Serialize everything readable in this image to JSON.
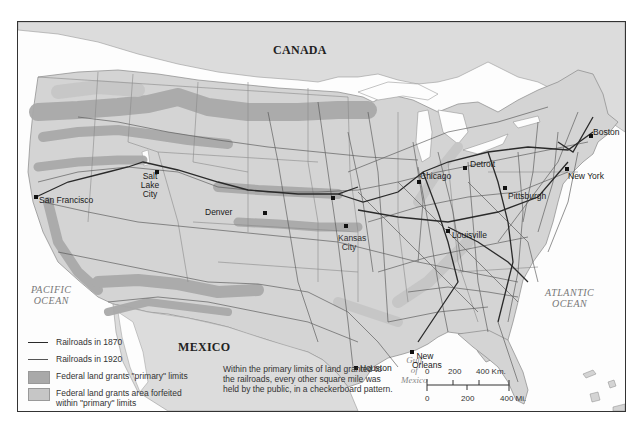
{
  "map": {
    "title": "",
    "countries": {
      "canada": "CANADA",
      "mexico": "MEXICO"
    },
    "oceans": {
      "pacific": [
        "PACIFIC",
        "OCEAN"
      ],
      "atlantic": [
        "ATLANTIC",
        "OCEAN"
      ],
      "gulf": [
        "Gulf",
        "of",
        "Mexico"
      ]
    },
    "cities": [
      {
        "name": "San Francisco",
        "x": 18,
        "y": 173
      },
      {
        "name": "Salt Lake City",
        "x": 124,
        "y": 150
      },
      {
        "name": "Denver",
        "x": 208,
        "y": 186
      },
      {
        "name": "Omaha",
        "x": 332,
        "y": 176
      },
      {
        "name": "Kansas City",
        "x": 347,
        "y": 204
      },
      {
        "name": "Chicago",
        "x": 419,
        "y": 161
      },
      {
        "name": "Detroit",
        "x": 464,
        "y": 146
      },
      {
        "name": "Louisville",
        "x": 446,
        "y": 210
      },
      {
        "name": "Pittsburgh",
        "x": 503,
        "y": 167
      },
      {
        "name": "New York",
        "x": 565,
        "y": 148
      },
      {
        "name": "Boston",
        "x": 590,
        "y": 115
      },
      {
        "name": "Houston",
        "x": 349,
        "y": 347
      },
      {
        "name": "New Orleans",
        "x": 416,
        "y": 330
      }
    ],
    "colors": {
      "land": "#d4d4d4",
      "neighbor_land": "#dcdcdc",
      "water": "#fdfdfd",
      "primary_grant": "#a9a9a9",
      "forfeited_grant": "#c2c2c2",
      "rail_1870": "#3a3a3a",
      "rail_1920": "#555555"
    }
  },
  "legend": {
    "items": [
      {
        "type": "line",
        "label": "Railroads in 1870",
        "color": "#2a2a2a",
        "width": 1.6
      },
      {
        "type": "line",
        "label": "Railroads in 1920",
        "color": "#555555",
        "width": 0.9
      },
      {
        "type": "box",
        "label": "Federal land grants \"primary\" limits",
        "color": "#a9a9a9"
      },
      {
        "type": "box",
        "label": "Federal land grants area forfeited within \"primary\" limits",
        "color": "#c6c6c6"
      }
    ]
  },
  "note": {
    "lines": [
      "Within the primary limits of land granted to",
      "the railroads, every other square mile was",
      "held by the public, in a checkerboard pattern."
    ]
  },
  "scale_bar": {
    "km_ticks": [
      "0",
      "200",
      "400 Km."
    ],
    "mi_ticks": [
      "0",
      "200",
      "400 Mi."
    ]
  }
}
